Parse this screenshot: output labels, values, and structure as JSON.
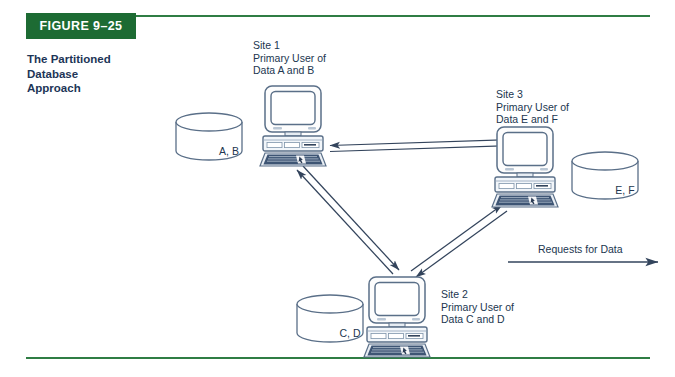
{
  "figure": {
    "banner_label": "FIGURE 9–25",
    "caption": "The Partitioned Database Approach",
    "caption_line1": "The Partitioned",
    "caption_line2": "Database",
    "caption_line3": "Approach",
    "banner_color": "#1d6b33",
    "rule_color": "#2f7d44",
    "text_color": "#21364f",
    "caption_color": "#1d3557",
    "line_color": "#33445c"
  },
  "sites": [
    {
      "id": "site-1",
      "name": "Site 1",
      "role_line1": "Primary User of",
      "role_line2": "Data A and B",
      "database_label": "A, B"
    },
    {
      "id": "site-3",
      "name": "Site 3",
      "role_line1": "Primary User of",
      "role_line2": "Data E and F",
      "database_label": "E, F"
    },
    {
      "id": "site-2",
      "name": "Site 2",
      "role_line1": "Primary User of",
      "role_line2": "Data C and D",
      "database_label": "C, D"
    }
  ],
  "legend": {
    "label": "Requests for Data"
  },
  "connections": [
    {
      "from": "Site 1",
      "to": "Site 3",
      "bidirectional": true
    },
    {
      "from": "Site 1",
      "to": "Site 2",
      "bidirectional": true
    },
    {
      "from": "Site 2",
      "to": "Site 3",
      "bidirectional": true
    }
  ]
}
